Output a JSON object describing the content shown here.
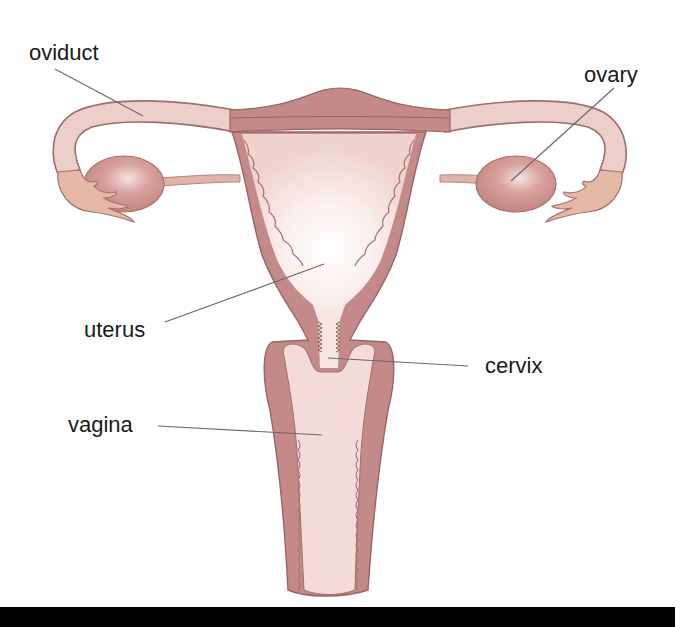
{
  "diagram": {
    "labels": {
      "oviduct": "oviduct",
      "ovary": "ovary",
      "uterus": "uterus",
      "cervix": "cervix",
      "vagina": "vagina"
    },
    "colors": {
      "tissue": "#c48a8a",
      "tissue_outline": "#9a6464",
      "lumen": "#f3dcd8",
      "tube": "#eccfc8",
      "ovary": "#d49a96",
      "fimbria": "#e6b9a6",
      "background": "#ffffff",
      "footer_bar": "#000000"
    }
  }
}
